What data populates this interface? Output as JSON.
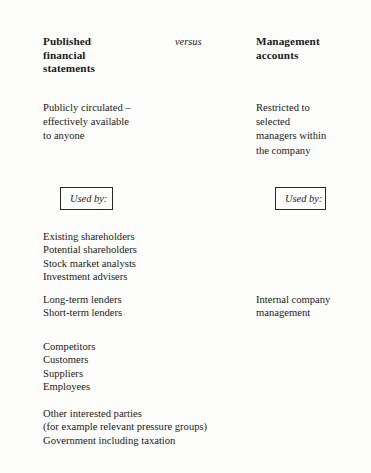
{
  "figure": {
    "columns": {
      "left_heading": "Published\nfinancial\nstatements",
      "left_heading_lines": [
        "Published",
        "financial",
        "statements"
      ],
      "middle_label": "versus",
      "right_heading_lines": [
        "Management",
        "accounts"
      ]
    },
    "availability": {
      "left_lines": [
        "Publicly circulated –",
        "effectively available",
        "to anyone"
      ],
      "right_lines": [
        "Restricted to",
        "selected",
        "managers within",
        "the company"
      ]
    },
    "used_by_label_left": "Used by:",
    "used_by_label_right": "Used by:",
    "users": {
      "group_1_left": [
        "Existing shareholders",
        "Potential shareholders",
        "Stock market analysts",
        "Investment advisers"
      ],
      "group_2_left": [
        "Long-term lenders",
        "Short-term lenders"
      ],
      "group_2_right": [
        "Internal company",
        "management"
      ],
      "group_3_left": [
        "Competitors",
        "Customers",
        "Suppliers",
        "Employees"
      ],
      "group_4_left": [
        "Other interested parties",
        "(for example relevant pressure groups)",
        "Government including taxation"
      ]
    },
    "colors": {
      "ink": "#1a1a1a",
      "rule": "#2e2e2e",
      "paper": "#fdfdfc"
    }
  }
}
